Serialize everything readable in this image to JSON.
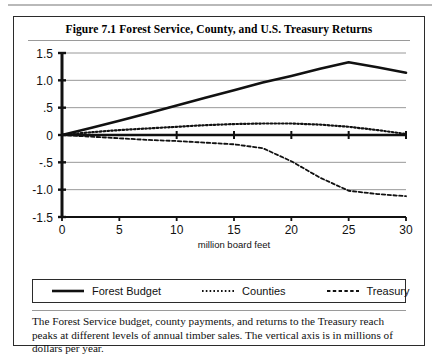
{
  "figure": {
    "title": "Figure 7.1   Forest Service, County, and U.S. Treasury Returns",
    "caption": "The Forest Service budget, county payments, and returns to the Treasury reach peaks at different levels of annual timber sales.  The vertical axis is in millions of dollars per year."
  },
  "legend": {
    "items": [
      {
        "label": "Forest Budget",
        "style": "solid",
        "color": "#111111"
      },
      {
        "label": "Counties",
        "style": "dotted",
        "color": "#111111"
      },
      {
        "label": "Treasury",
        "style": "dashed",
        "color": "#111111"
      }
    ]
  },
  "chart_data": {
    "type": "line",
    "title": "Figure 7.1   Forest Service, County, and U.S. Treasury Returns",
    "xlabel": "million board feet",
    "ylabel": "",
    "xlim": [
      0,
      30
    ],
    "ylim": [
      -1.5,
      1.5
    ],
    "grid": true,
    "legend_position": "below-plot",
    "xticks": [
      0,
      5,
      10,
      15,
      20,
      25,
      30
    ],
    "xticklabels": [
      "0",
      "5",
      "10",
      "15",
      "20",
      "25",
      "30"
    ],
    "yticks": [
      1.5,
      1.0,
      0.5,
      0,
      -0.5,
      -1.0,
      -1.5
    ],
    "yticklabels": [
      "1.5",
      "1.0",
      ".5",
      "0",
      "-.5",
      "-1.0",
      "-1.5"
    ],
    "zero_line": true,
    "x": [
      0,
      2.5,
      5,
      7.5,
      10,
      12.5,
      15,
      17.5,
      20,
      22.5,
      25,
      27.5,
      30
    ],
    "series": [
      {
        "name": "Forest Budget",
        "style": "solid",
        "values": [
          0,
          0.13,
          0.26,
          0.4,
          0.54,
          0.68,
          0.82,
          0.96,
          1.08,
          1.21,
          1.33,
          1.24,
          1.14
        ]
      },
      {
        "name": "Counties",
        "style": "dotted",
        "values": [
          0,
          0.05,
          0.09,
          0.12,
          0.15,
          0.18,
          0.2,
          0.21,
          0.21,
          0.19,
          0.15,
          0.09,
          0.02
        ]
      },
      {
        "name": "Treasury",
        "style": "dashed",
        "values": [
          0,
          -0.03,
          -0.06,
          -0.09,
          -0.11,
          -0.14,
          -0.17,
          -0.24,
          -0.48,
          -0.78,
          -1.02,
          -1.08,
          -1.12
        ]
      }
    ]
  }
}
